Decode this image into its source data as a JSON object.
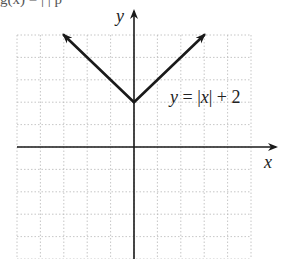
{
  "header_fragment": "g(x) = | | p",
  "chart_data": {
    "type": "line",
    "title": "",
    "xlabel": "x",
    "ylabel": "y",
    "xlim": [
      -5,
      5
    ],
    "ylim": [
      -5,
      5
    ],
    "grid": true,
    "grid_style": "dotted",
    "series": [
      {
        "name": "y = |x| + 2",
        "x": [
          -3,
          -2,
          -1,
          0,
          1,
          2,
          3
        ],
        "values": [
          5,
          4,
          3,
          2,
          3,
          4,
          5
        ],
        "arrows_at_ends": true,
        "color": "#1a1a1a"
      }
    ],
    "annotations": [
      {
        "text_parts": [
          "y",
          " = |",
          "x",
          "| + 2"
        ],
        "x": 1.5,
        "y": 2.0
      }
    ]
  },
  "labels": {
    "x_axis": "x",
    "y_axis": "y",
    "eq_y": "y",
    "eq_mid": " = |",
    "eq_x": "x",
    "eq_end": "| + 2"
  }
}
